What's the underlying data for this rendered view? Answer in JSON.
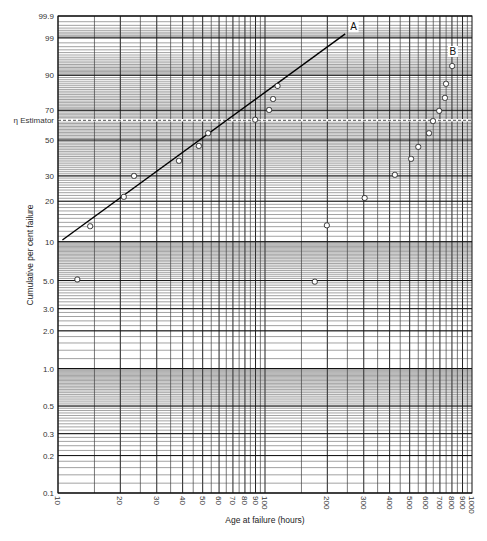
{
  "chart_data": {
    "type": "scatter",
    "title": "",
    "xlabel": "Age at failure (hours)",
    "ylabel": "Cumulative per cent failure",
    "x_scale": "log",
    "y_scale": "weibull",
    "xlim": [
      10,
      1000
    ],
    "ylim": [
      0.1,
      99.9
    ],
    "grid": true,
    "x_ticks": [
      10,
      20,
      30,
      40,
      50,
      60,
      70,
      80,
      90,
      100,
      200,
      300,
      400,
      500,
      600,
      700,
      800,
      900,
      1000
    ],
    "x_tick_labels": [
      "10",
      "20",
      "30",
      "40",
      "50",
      "60",
      "70",
      "80",
      "90",
      "100",
      "200",
      "300",
      "400",
      "500",
      "600",
      "700",
      "800",
      "900",
      "1000"
    ],
    "y_ticks": [
      0.1,
      0.2,
      0.3,
      0.5,
      1.0,
      2.0,
      3.0,
      5.0,
      10,
      20,
      30,
      50,
      70,
      90,
      99,
      99.9
    ],
    "y_tick_labels": [
      "0.1",
      "0.2",
      "0.3",
      "0.5",
      "1.0",
      "2.0",
      "3.0",
      "5.0",
      "10",
      "20",
      "30",
      "50",
      "70",
      "90",
      "99",
      "99.9"
    ],
    "eta_line": {
      "label": "η Estimator",
      "value": 63.2
    },
    "fit_line": {
      "label": "A",
      "x": [
        10.5,
        244
      ],
      "y": [
        10.3,
        99.3
      ]
    },
    "series": [
      {
        "name": "A",
        "points": [
          [
            12.4,
            5.1
          ],
          [
            14.3,
            13.1
          ],
          [
            20.8,
            21.5
          ],
          [
            23.3,
            30.0
          ],
          [
            38.4,
            37.6
          ],
          [
            47.9,
            46.3
          ],
          [
            53.1,
            54.5
          ],
          [
            89.6,
            63.6
          ],
          [
            104.7,
            70.2
          ],
          [
            109.4,
            77.3
          ],
          [
            115.0,
            84.9
          ]
        ]
      },
      {
        "name": "middle",
        "points": [
          [
            174,
            4.9
          ],
          [
            199,
            13.3
          ],
          [
            303,
            21.1
          ]
        ]
      },
      {
        "name": "B",
        "label_pos": [
          800,
          96.5
        ],
        "points": [
          [
            424,
            30.5
          ],
          [
            508,
            38.7
          ],
          [
            550,
            45.7
          ],
          [
            620,
            54.5
          ],
          [
            648,
            62.7
          ],
          [
            694,
            69.6
          ],
          [
            740,
            78.0
          ],
          [
            749,
            86.0
          ],
          [
            802,
            93.5
          ]
        ]
      }
    ],
    "annotations": [
      {
        "text": "A",
        "x": 265,
        "y": 99.5
      },
      {
        "text": "B",
        "x": 800,
        "y": 96.5
      }
    ]
  }
}
